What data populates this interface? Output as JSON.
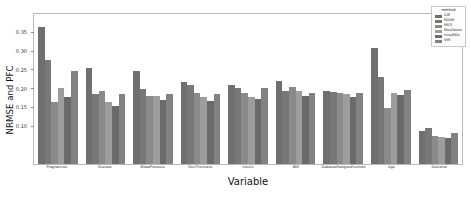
{
  "chart_data": {
    "type": "bar",
    "title": "",
    "xlabel": "Variable",
    "ylabel": "NRMSE and PFC",
    "ylim": [
      0.0,
      0.4
    ],
    "grid": false,
    "legend_position": "top-right",
    "legend_title": "method",
    "yticks": [
      0.1,
      0.15,
      0.2,
      0.25,
      0.3,
      0.35
    ],
    "ytick_labels": [
      "0.10",
      "0.15",
      "0.20",
      "0.25",
      "0.30",
      "0.35"
    ],
    "categories": [
      "Pregnancies",
      "Glucose",
      "BloodPressure",
      "SkinThickness",
      "Insulin",
      "BMI",
      "DiabetesPedigreeFunction",
      "Age",
      "Outcome"
    ],
    "series": [
      {
        "name": "GIR",
        "color": "#6f6f6f",
        "values": [
          0.365,
          0.255,
          0.248,
          0.218,
          0.212,
          0.222,
          0.196,
          0.31,
          0.088
        ]
      },
      {
        "name": "RDAM",
        "color": "#787878",
        "values": [
          0.278,
          0.188,
          0.2,
          0.212,
          0.204,
          0.196,
          0.192,
          0.232,
          0.096
        ]
      },
      {
        "name": "MICE",
        "color": "#8a8a8a",
        "values": [
          0.166,
          0.196,
          0.182,
          0.19,
          0.19,
          0.206,
          0.19,
          0.15,
          0.076
        ]
      },
      {
        "name": "MissForest",
        "color": "#9d9d9d",
        "values": [
          0.202,
          0.166,
          0.182,
          0.178,
          0.18,
          0.196,
          0.188,
          0.19,
          0.072
        ]
      },
      {
        "name": "missMDA",
        "color": "#6a6a6a",
        "values": [
          0.18,
          0.156,
          0.172,
          0.168,
          0.174,
          0.182,
          0.178,
          0.184,
          0.07
        ]
      },
      {
        "name": "VIM",
        "color": "#828282",
        "values": [
          0.248,
          0.186,
          0.186,
          0.188,
          0.202,
          0.19,
          0.19,
          0.198,
          0.084
        ]
      }
    ]
  }
}
